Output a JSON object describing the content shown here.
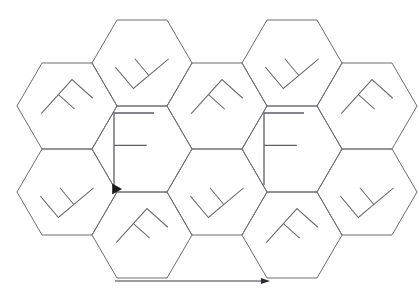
{
  "figure": {
    "background_color": "#ffffff",
    "line_color": "#6e6e72",
    "marker_color": "#1a1a1a",
    "arrow_color": "#2c2c30",
    "letter_color": "#5f5f64"
  },
  "geometry": {
    "hex_half_width": 50,
    "hex_half_height": 43,
    "hex_side_run": 25,
    "column_pitch": 75,
    "row_pitch": 86
  },
  "hexagons": [
    {
      "id": "hex-r1-c2",
      "cx": 142,
      "cy": 63,
      "content": "glyph",
      "glyph_rotation": -130,
      "label": ""
    },
    {
      "id": "hex-r1-c4",
      "cx": 292,
      "cy": 63,
      "content": "glyph",
      "glyph_rotation": -130,
      "label": ""
    },
    {
      "id": "hex-r2-c1",
      "cx": 67,
      "cy": 106,
      "content": "glyph",
      "glyph_rotation": 42,
      "label": ""
    },
    {
      "id": "hex-r2-c2",
      "cx": 142,
      "cy": 149,
      "content": "letter",
      "glyph_rotation": 0,
      "label": "F"
    },
    {
      "id": "hex-r2-c3",
      "cx": 217,
      "cy": 106,
      "content": "glyph",
      "glyph_rotation": 42,
      "label": ""
    },
    {
      "id": "hex-r2-c4",
      "cx": 292,
      "cy": 149,
      "content": "letter",
      "glyph_rotation": 0,
      "label": "F"
    },
    {
      "id": "hex-r2-c5",
      "cx": 367,
      "cy": 106,
      "content": "glyph",
      "glyph_rotation": 42,
      "label": ""
    },
    {
      "id": "hex-r3-c1",
      "cx": 67,
      "cy": 192,
      "content": "glyph",
      "glyph_rotation": -130,
      "label": ""
    },
    {
      "id": "hex-r3-c2",
      "cx": 142,
      "cy": 235,
      "content": "glyph",
      "glyph_rotation": 42,
      "label": ""
    },
    {
      "id": "hex-r3-c3",
      "cx": 217,
      "cy": 192,
      "content": "glyph",
      "glyph_rotation": -130,
      "label": ""
    },
    {
      "id": "hex-r3-c4",
      "cx": 292,
      "cy": 235,
      "content": "glyph",
      "glyph_rotation": 42,
      "label": ""
    },
    {
      "id": "hex-r3-c5",
      "cx": 367,
      "cy": 192,
      "content": "glyph",
      "glyph_rotation": -130,
      "label": ""
    }
  ],
  "letters": [
    {
      "id": "letter-f-left",
      "text": "F",
      "cx": 134,
      "cy": 149
    },
    {
      "id": "letter-f-right",
      "text": "F",
      "cx": 284,
      "cy": 149
    }
  ],
  "marker": {
    "id": "origin-marker",
    "shape": "filled-triangle",
    "x": 117,
    "y": 189,
    "size": 9
  },
  "arrow": {
    "id": "direction-arrow",
    "orientation": "horizontal-right",
    "x1": 115,
    "x2": 270,
    "y": 281,
    "head_length": 9,
    "head_width": 6
  },
  "annotations": {
    "glyph_name": "rotated-f-glyph",
    "glyph_count": 12,
    "letter_count": 2,
    "marker_count": 1,
    "arrow_count": 1
  }
}
